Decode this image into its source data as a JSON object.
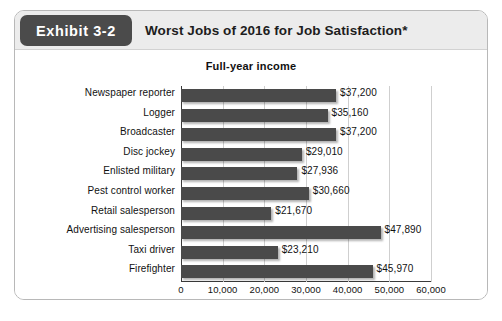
{
  "header": {
    "badge_label": "Exhibit 3-2",
    "title": "Worst Jobs of 2016 for Job Satisfaction*",
    "badge_color": "#4b4b4b",
    "band_color": "#ececec"
  },
  "chart_data": {
    "type": "bar",
    "orientation": "horizontal",
    "title": "Full-year income",
    "xlabel": "",
    "ylabel": "",
    "xlim": [
      0,
      60000
    ],
    "grid": true,
    "legend": null,
    "bar_color": "#4a4a4a",
    "xticks": [
      "0",
      "10,000",
      "20,000",
      "30,000",
      "40,000",
      "50,000",
      "60,000"
    ],
    "xtick_values": [
      0,
      10000,
      20000,
      30000,
      40000,
      50000,
      60000
    ],
    "categories": [
      "Newspaper reporter",
      "Logger",
      "Broadcaster",
      "Disc jockey",
      "Enlisted military",
      "Pest control worker",
      "Retail salesperson",
      "Advertising salesperson",
      "Taxi driver",
      "Firefighter"
    ],
    "values": [
      37200,
      35160,
      37200,
      29010,
      27936,
      30660,
      21670,
      47890,
      23210,
      45970
    ],
    "value_labels": [
      "$37,200",
      "$35,160",
      "$37,200",
      "$29,010",
      "$27,936",
      "$30,660",
      "$21,670",
      "$47,890",
      "$23,210",
      "$45,970"
    ]
  }
}
